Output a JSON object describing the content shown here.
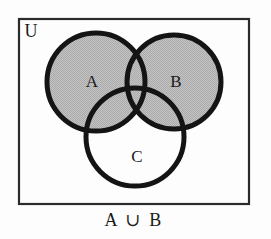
{
  "diagram": {
    "type": "venn",
    "universe": {
      "label": "U",
      "label_x": 31,
      "label_y": 33,
      "rect": {
        "x": 19,
        "y": 19,
        "width": 230,
        "height": 185
      },
      "border_color": "#2b2b2b",
      "fill_color": "#fdfdfd"
    },
    "sets": [
      {
        "name": "A",
        "label": "A",
        "cx": 96,
        "cy": 82,
        "r": 49,
        "label_x": 92,
        "label_y": 83,
        "shaded": true
      },
      {
        "name": "B",
        "label": "B",
        "cx": 174,
        "cy": 82,
        "r": 47,
        "label_x": 176,
        "label_y": 83,
        "shaded": true
      },
      {
        "name": "C",
        "label": "C",
        "cx": 135,
        "cy": 137,
        "r": 49,
        "label_x": 137,
        "label_y": 158,
        "shaded": false
      }
    ],
    "shading": {
      "region_expression": "A ∪ B",
      "fill_color": "#bdbdbd",
      "stroke_color": "#141414",
      "stroke_width": 5
    },
    "caption": {
      "text": "A ∪ B",
      "x": 134,
      "y": 222
    }
  }
}
